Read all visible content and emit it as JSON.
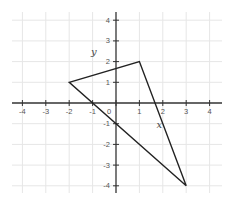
{
  "diagram": {
    "type": "coordinate-plane-triangle",
    "x_range": [
      -4,
      4
    ],
    "y_range": [
      -4,
      4
    ],
    "x_ticks": [
      -4,
      -3,
      -2,
      -1,
      0,
      1,
      2,
      3,
      4
    ],
    "y_ticks": [
      -4,
      -3,
      -2,
      -1,
      1,
      2,
      3,
      4
    ],
    "x_tick_labels": [
      "-4",
      "-3",
      "-2",
      "-1",
      "0",
      "1",
      "2",
      "3",
      "4"
    ],
    "y_tick_labels": [
      "-4",
      "-3",
      "-2",
      "-1",
      "1",
      "2",
      "3",
      "4"
    ],
    "grid": true,
    "triangle": {
      "vertices": [
        [
          -2,
          1
        ],
        [
          1,
          2
        ],
        [
          3,
          -4
        ]
      ]
    },
    "labels": [
      {
        "text": "y",
        "at": [
          -0.95,
          2.3
        ]
      },
      {
        "text": "x",
        "at": [
          1.85,
          -1.2
        ]
      }
    ],
    "colors": {
      "grid": "#e6e6e6",
      "axis": "#333333",
      "shape": "#222222",
      "text": "#555555"
    }
  }
}
